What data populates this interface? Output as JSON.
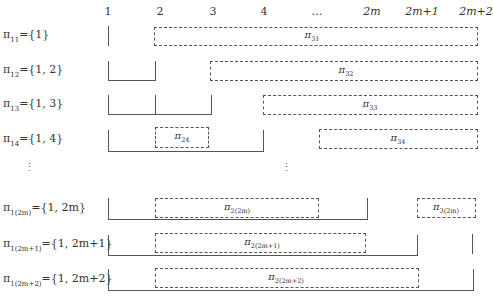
{
  "columns": [
    {
      "label": "1",
      "x": 108
    },
    {
      "label": "2",
      "x": 160
    },
    {
      "label": "3",
      "x": 213
    },
    {
      "label": "4",
      "x": 264
    },
    {
      "label": "…",
      "x": 317
    },
    {
      "label": "2m",
      "x": 372
    },
    {
      "label": "2m+1",
      "x": 422
    },
    {
      "label": "2m+2",
      "x": 476
    }
  ],
  "rows": [
    {
      "label_base": "π",
      "label_sub": "11",
      "label_set": "={1}"
    },
    {
      "label_base": "π",
      "label_sub": "12",
      "label_set": "={1, 2}"
    },
    {
      "label_base": "π",
      "label_sub": "13",
      "label_set": "={1, 3}"
    },
    {
      "label_base": "π",
      "label_sub": "14",
      "label_set": "={1, 4}"
    },
    {
      "label_base": "π",
      "label_sub": "1(2m)",
      "label_set": "={1, 2m}"
    },
    {
      "label_base": "π",
      "label_sub": "1(2m+1)",
      "label_set": "={1, 2m+1}"
    },
    {
      "label_base": "π",
      "label_sub": "1(2m+2)",
      "label_set": "={1, 2m+2}"
    }
  ],
  "boxes": [
    {
      "base": "π",
      "sub": "31"
    },
    {
      "base": "π",
      "sub": "32"
    },
    {
      "base": "π",
      "sub": "33"
    },
    {
      "base": "π",
      "sub": "24"
    },
    {
      "base": "π",
      "sub": "34"
    },
    {
      "base": "π",
      "sub": "2(2m)"
    },
    {
      "base": "π",
      "sub": "3(2m)"
    },
    {
      "base": "π",
      "sub": "2(2m+1)"
    },
    {
      "base": "π",
      "sub": "2(2m+2)"
    }
  ],
  "ellipsis": {
    "vertical": "⋮"
  }
}
